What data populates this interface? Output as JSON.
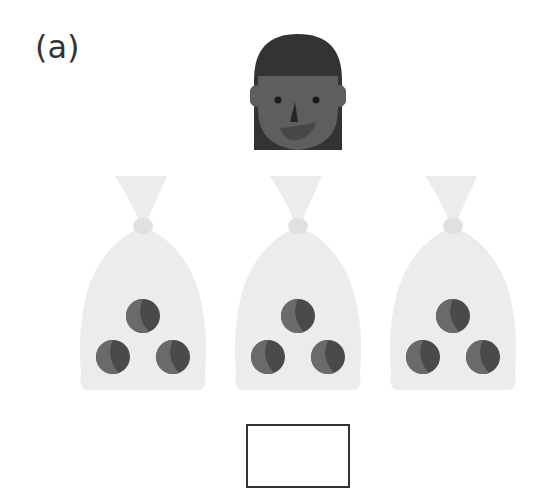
{
  "question": {
    "label": "(a)",
    "character": {
      "icon": "girl-face-icon",
      "hair_color": "#333333",
      "skin_color": "#5e5e5e"
    },
    "bags": [
      {
        "id": 1,
        "icon": "bag-icon",
        "balls": 3
      },
      {
        "id": 2,
        "icon": "bag-icon",
        "balls": 3
      },
      {
        "id": 3,
        "icon": "bag-icon",
        "balls": 3
      }
    ],
    "answer_box": {
      "value": ""
    }
  },
  "colors": {
    "bag_fill": "#ececec",
    "ball_fill": "#4a4a4a",
    "ball_highlight": "#6a6a6a",
    "border": "#333333"
  }
}
